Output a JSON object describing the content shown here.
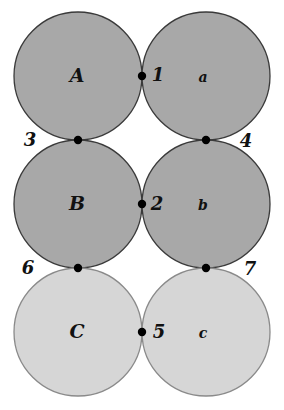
{
  "diagram": {
    "colors": {
      "dark_fill": "#a8a8a8",
      "light_fill": "#d6d6d6",
      "dark_stroke": "#3a3a3a",
      "light_stroke": "#8a8a8a",
      "point": "#000000",
      "text": "#111111"
    },
    "circles": [
      {
        "label": "A",
        "shade": "dark",
        "row": 0,
        "col": 0
      },
      {
        "label": "a",
        "shade": "dark",
        "row": 0,
        "col": 1
      },
      {
        "label": "B",
        "shade": "dark",
        "row": 1,
        "col": 0
      },
      {
        "label": "b",
        "shade": "dark",
        "row": 1,
        "col": 1
      },
      {
        "label": "C",
        "shade": "light",
        "row": 2,
        "col": 0
      },
      {
        "label": "c",
        "shade": "light",
        "row": 2,
        "col": 1
      }
    ],
    "points": [
      {
        "label": "1",
        "between": [
          "A",
          "a"
        ]
      },
      {
        "label": "2",
        "between": [
          "B",
          "b"
        ]
      },
      {
        "label": "3",
        "between": [
          "A",
          "B"
        ]
      },
      {
        "label": "4",
        "between": [
          "a",
          "b"
        ]
      },
      {
        "label": "5",
        "between": [
          "C",
          "c"
        ]
      },
      {
        "label": "6",
        "between": [
          "B",
          "C"
        ]
      },
      {
        "label": "7",
        "between": [
          "b",
          "c"
        ]
      }
    ]
  }
}
